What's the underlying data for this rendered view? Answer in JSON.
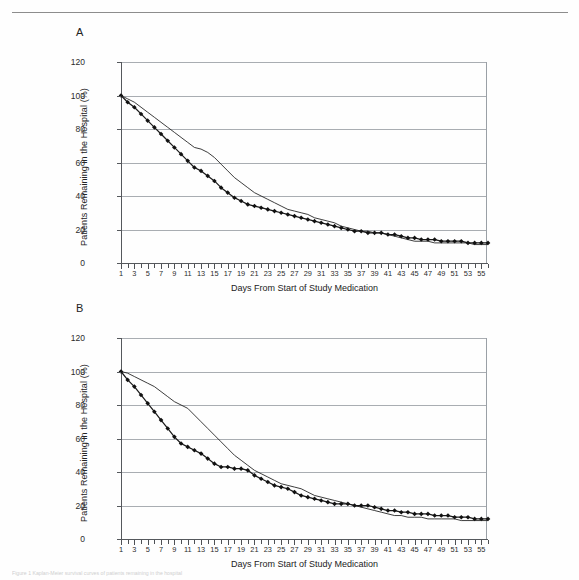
{
  "figure": {
    "panel_a_label": "A",
    "panel_b_label": "B",
    "caption_partial": "Figure 1 Kaplan-Meier survival curves of patients remaining in the hospital"
  },
  "axes": {
    "ylabel": "Patients Remaining in the Hospital (%)",
    "xlabel": "Days From Start of Study Medication",
    "yticks": [
      0,
      20,
      40,
      60,
      80,
      100,
      120
    ],
    "ylim": [
      0,
      120
    ],
    "xlim": [
      1,
      56
    ],
    "xticks_labeled": [
      1,
      3,
      5,
      7,
      9,
      11,
      13,
      15,
      17,
      19,
      21,
      23,
      25,
      27,
      29,
      31,
      33,
      35,
      37,
      39,
      41,
      43,
      45,
      47,
      49,
      51,
      53,
      55
    ],
    "xticks_all_min": 1,
    "xticks_all_max": 56,
    "grid": "horizontal"
  },
  "chart_data": [
    {
      "type": "line",
      "title": "A",
      "xlabel": "Days From Start of Study Medication",
      "ylabel": "Patients Remaining in the Hospital (%)",
      "xlim": [
        1,
        56
      ],
      "ylim": [
        0,
        120
      ],
      "grid": true,
      "legend": "none",
      "x": [
        1,
        2,
        3,
        4,
        5,
        6,
        7,
        8,
        9,
        10,
        11,
        12,
        13,
        14,
        15,
        16,
        17,
        18,
        19,
        20,
        21,
        22,
        23,
        24,
        25,
        26,
        27,
        28,
        29,
        30,
        31,
        32,
        33,
        34,
        35,
        36,
        37,
        38,
        39,
        40,
        41,
        42,
        43,
        44,
        45,
        46,
        47,
        48,
        49,
        50,
        51,
        52,
        53,
        54,
        55,
        56
      ],
      "series": [
        {
          "name": "marker-series",
          "marker": "diamond",
          "values": [
            100,
            96,
            93,
            89,
            85,
            81,
            77,
            73,
            69,
            65,
            61,
            57,
            55,
            52,
            49,
            45,
            42,
            39,
            37,
            35,
            34,
            33,
            32,
            31,
            30,
            29,
            28,
            27,
            26,
            25,
            24,
            23,
            22,
            21,
            20,
            19,
            19,
            18,
            18,
            18,
            17,
            17,
            16,
            15,
            15,
            14,
            14,
            14,
            13,
            13,
            13,
            13,
            12,
            12,
            12,
            12
          ]
        },
        {
          "name": "line-series",
          "marker": "none",
          "values": [
            100,
            98,
            96,
            93,
            90,
            87,
            84,
            81,
            78,
            75,
            72,
            69,
            68,
            66,
            63,
            59,
            55,
            51,
            48,
            45,
            42,
            40,
            38,
            36,
            34,
            32,
            31,
            30,
            29,
            27,
            26,
            25,
            24,
            22,
            21,
            20,
            19,
            19,
            18,
            18,
            17,
            16,
            15,
            14,
            13,
            13,
            13,
            12,
            12,
            12,
            12,
            12,
            12,
            11,
            11,
            11
          ]
        }
      ]
    },
    {
      "type": "line",
      "title": "B",
      "xlabel": "Days From Start of Study Medication",
      "ylabel": "Patients Remaining in the Hospital (%)",
      "xlim": [
        1,
        56
      ],
      "ylim": [
        0,
        120
      ],
      "grid": true,
      "legend": "none",
      "x": [
        1,
        2,
        3,
        4,
        5,
        6,
        7,
        8,
        9,
        10,
        11,
        12,
        13,
        14,
        15,
        16,
        17,
        18,
        19,
        20,
        21,
        22,
        23,
        24,
        25,
        26,
        27,
        28,
        29,
        30,
        31,
        32,
        33,
        34,
        35,
        36,
        37,
        38,
        39,
        40,
        41,
        42,
        43,
        44,
        45,
        46,
        47,
        48,
        49,
        50,
        51,
        52,
        53,
        54,
        55,
        56
      ],
      "series": [
        {
          "name": "marker-series",
          "marker": "diamond",
          "values": [
            100,
            95,
            91,
            86,
            81,
            76,
            71,
            66,
            61,
            57,
            55,
            53,
            51,
            48,
            45,
            43,
            43,
            42,
            42,
            41,
            38,
            36,
            34,
            32,
            31,
            30,
            28,
            26,
            25,
            24,
            23,
            22,
            21,
            21,
            21,
            20,
            20,
            20,
            19,
            18,
            17,
            17,
            16,
            16,
            15,
            15,
            15,
            14,
            14,
            14,
            13,
            13,
            13,
            12,
            12,
            12
          ]
        },
        {
          "name": "line-series",
          "marker": "none",
          "values": [
            100,
            99,
            97,
            95,
            93,
            91,
            88,
            85,
            82,
            80,
            78,
            74,
            70,
            66,
            62,
            58,
            54,
            50,
            47,
            44,
            41,
            39,
            37,
            35,
            33,
            32,
            31,
            30,
            28,
            26,
            25,
            24,
            23,
            22,
            21,
            20,
            19,
            18,
            17,
            16,
            15,
            14,
            14,
            13,
            13,
            13,
            12,
            12,
            12,
            12,
            12,
            11,
            11,
            11,
            11,
            11
          ]
        }
      ]
    }
  ]
}
